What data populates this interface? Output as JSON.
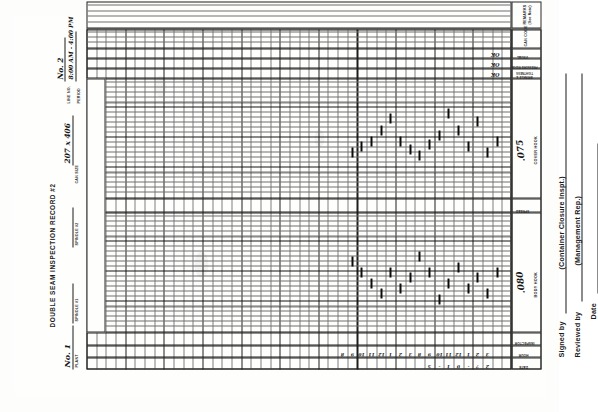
{
  "document": {
    "title": "DOUBLE SEAM INSPECTION RECORD #2",
    "type": "scanned-paper-form",
    "orientation": "rotated-90-ccw"
  },
  "header": {
    "plant_label": "PLANT",
    "plant_value": "No. 1",
    "spindle1_label": "SPINDLE #1",
    "spindle2_label": "SPINDLE #2",
    "can_size_label": "CAN SIZE",
    "can_size_value": "207 x 406",
    "line_no_label": "LINE NO.",
    "line_no_value": "No. 2",
    "period_label": "PERIOD",
    "period_value": "8:00 AM - 4:00 PM"
  },
  "row_labels": {
    "date": "DATE",
    "hour": "HOUR",
    "inspector": "INSPECTOR"
  },
  "column_sections": [
    {
      "name": "body-hook",
      "label": "BODY HOOK",
      "nominal": ".080"
    },
    {
      "name": "spread",
      "label": "SPREAD",
      "nominal": ""
    },
    {
      "name": "cover-hook",
      "label": "COVER HOOK",
      "nominal": ".075"
    }
  ],
  "check_columns": [
    {
      "name": "wrinkle-tightness",
      "label": "WRINKLE &\nTIGHTNESS",
      "mark": "OK"
    },
    {
      "name": "pressure-ridge",
      "label": "PRESSURE\nRIDGE",
      "mark": "OK"
    },
    {
      "name": "visual",
      "label": "VISUAL",
      "mark": "OK"
    }
  ],
  "right_sections": [
    {
      "name": "can-code",
      "label": "CAN CODE"
    },
    {
      "name": "remarks",
      "label": "REMARKS",
      "sublabel": "(See Note)"
    }
  ],
  "date_row": {
    "values": [
      "5",
      "-",
      "1",
      "0",
      "-",
      "7",
      "2"
    ]
  },
  "hour_row": {
    "values": [
      "8",
      "9",
      "10",
      "11",
      "12",
      "1",
      "2",
      "3",
      "8",
      "9",
      "10",
      "11",
      "12",
      "1",
      "2",
      "3"
    ]
  },
  "signature_block": {
    "signed_by": "Signed by",
    "signed_by_role": "(Container Closure Inspt.)",
    "reviewed_by": "Reviewed by",
    "reviewed_by_role": "(Management Rep.)",
    "date": "Date"
  },
  "chart_data": {
    "type": "line",
    "title": "DOUBLE SEAM INSPECTION RECORD #2",
    "xlabel": "Measurement value (grid units, inches)",
    "ylabel": "Inspection sample (hour)",
    "grid": true,
    "legend": "none",
    "series": [
      {
        "name": "BODY HOOK",
        "nominal": 0.08,
        "spec_lines": [
          0.062,
          0.098
        ],
        "values": [
          0.084,
          0.08,
          0.076,
          0.072,
          0.08,
          0.074,
          0.078,
          0.086,
          0.08,
          0.07,
          0.076,
          0.082,
          0.074,
          0.078,
          0.072,
          0.08
        ]
      },
      {
        "name": "COVER HOOK",
        "nominal": 0.075,
        "spec_lines": [
          0.058,
          0.092
        ],
        "values": [
          0.07,
          0.072,
          0.074,
          0.078,
          0.082,
          0.074,
          0.071,
          0.069,
          0.073,
          0.076,
          0.084,
          0.078,
          0.072,
          0.081,
          0.07,
          0.074
        ]
      }
    ]
  }
}
